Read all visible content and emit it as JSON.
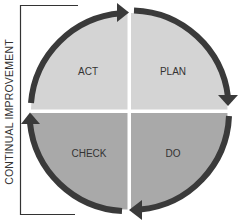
{
  "diagram": {
    "side_label": "CONTINUAL IMPROVEMENT",
    "quadrants": [
      {
        "id": "act",
        "label": "ACT",
        "position": "top-left",
        "color": "#d4d4d4"
      },
      {
        "id": "plan",
        "label": "PLAN",
        "position": "top-right",
        "color": "#d4d4d4"
      },
      {
        "id": "check",
        "label": "CHECK",
        "position": "bottom-left",
        "color": "#a9a9a9"
      },
      {
        "id": "do",
        "label": "DO",
        "position": "bottom-right",
        "color": "#a9a9a9"
      }
    ],
    "arrow_color": "#3a3a3a",
    "text_color": "#333333",
    "bracket_color": "#333333"
  }
}
